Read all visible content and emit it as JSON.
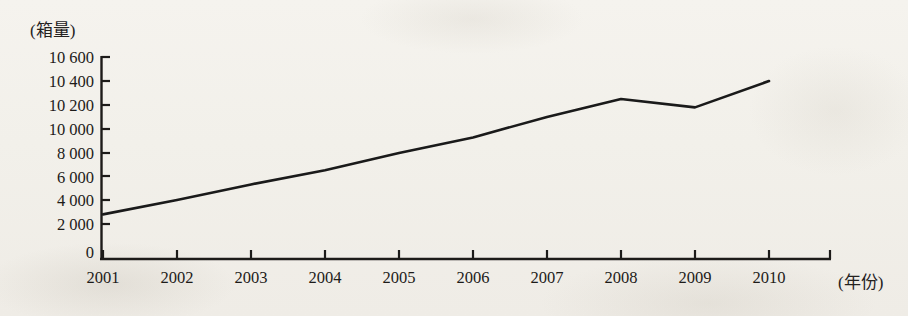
{
  "chart_data": {
    "type": "line",
    "title": "",
    "subtitle": "",
    "xlabel": "(年份)",
    "ylabel": "(箱量)",
    "categories": [
      "2001",
      "2002",
      "2003",
      "2004",
      "2005",
      "2006",
      "2007",
      "2008",
      "2009",
      "2010"
    ],
    "series": [
      {
        "name": "箱量",
        "values": [
          2800,
          4000,
          5300,
          6500,
          8000,
          9300,
          10100,
          10250,
          10180,
          10400
        ]
      }
    ],
    "y_tick_labels": [
      "10 600",
      "10 400",
      "10 200",
      "10 000",
      "8 000",
      "6 000",
      "4 000",
      "2 000",
      "0"
    ],
    "y_tick_values": [
      10600,
      10400,
      10200,
      10000,
      8000,
      6000,
      4000,
      2000,
      0
    ],
    "x_tick_labels": [
      "2001",
      "2002",
      "2003",
      "2004",
      "2005",
      "2006",
      "2007",
      "2008",
      "2009",
      "2010"
    ],
    "ylim": [
      0,
      10600
    ],
    "y_axis_broken": true,
    "grid": false,
    "legend": "none",
    "line_color": "#1a1a1a",
    "axis_color": "#1d1b19",
    "background_color": "#f2f0ea"
  }
}
